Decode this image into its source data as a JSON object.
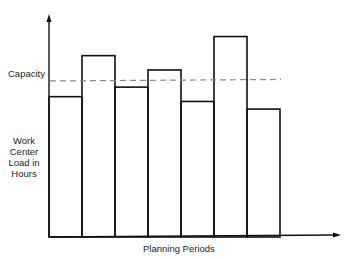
{
  "chart_data": {
    "type": "bar",
    "title": "",
    "xlabel": "Planning Periods",
    "ylabel_lines": [
      "Work",
      "Center",
      "Load in",
      "Hours"
    ],
    "categories": [
      "1",
      "2",
      "3",
      "4",
      "5",
      "6",
      "7"
    ],
    "values": [
      147,
      190,
      157,
      175,
      142,
      210,
      134
    ],
    "ylim": [
      0,
      220
    ],
    "capacity": {
      "label": "Capacity",
      "value": 164
    },
    "grid": false,
    "legend": "none"
  }
}
